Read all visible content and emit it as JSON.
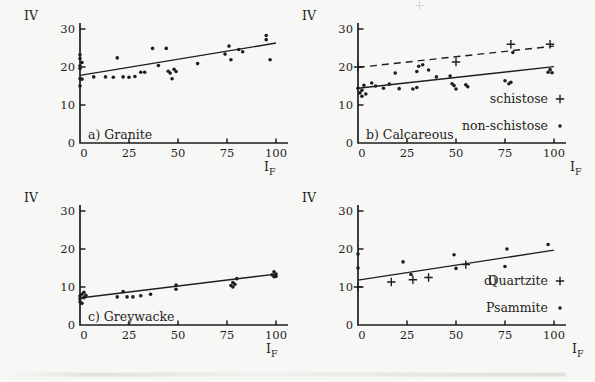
{
  "figure": {
    "background": "#f7f7f5",
    "ink": "#1e1e1c",
    "y_axis_label": "IV",
    "x_axis_label": "I",
    "x_axis_label_sub": "F"
  },
  "chart_data": [
    {
      "id": "a",
      "type": "scatter",
      "title": "a) Granite",
      "xlabel": "IF",
      "ylabel": "IV",
      "xlim": [
        0,
        100
      ],
      "ylim": [
        0,
        30
      ],
      "xticks": [
        0,
        25,
        50,
        75,
        100
      ],
      "yticks": [
        0,
        10,
        20,
        30
      ],
      "grid": false,
      "series": [
        {
          "name": "granite",
          "marker": "dot",
          "points": [
            [
              0,
              15
            ],
            [
              0,
              16.9
            ],
            [
              1,
              16.8
            ],
            [
              0,
              19.6
            ],
            [
              0,
              20.3
            ],
            [
              1,
              21.2
            ],
            [
              0,
              22.2
            ],
            [
              0,
              23.2
            ],
            [
              7,
              17.4
            ],
            [
              13,
              17.4
            ],
            [
              17,
              17.3
            ],
            [
              19,
              22.4
            ],
            [
              22,
              17.4
            ],
            [
              25,
              17.3
            ],
            [
              28,
              17.5
            ],
            [
              31,
              18.6
            ],
            [
              33,
              18.6
            ],
            [
              37,
              24.9
            ],
            [
              40,
              20.4
            ],
            [
              44,
              24.9
            ],
            [
              45,
              18.9
            ],
            [
              46,
              18.4
            ],
            [
              47,
              16.9
            ],
            [
              48,
              19.4
            ],
            [
              49,
              18.8
            ],
            [
              60,
              20.9
            ],
            [
              74,
              23.4
            ],
            [
              76,
              25.5
            ],
            [
              77,
              21.9
            ],
            [
              81,
              24.6
            ],
            [
              83,
              24
            ],
            [
              95,
              28.3
            ],
            [
              95,
              27.2
            ],
            [
              97,
              21.9
            ]
          ]
        }
      ],
      "trend_lines": [
        {
          "style": "solid",
          "from": [
            0,
            17.8
          ],
          "to": [
            100,
            26.3
          ]
        }
      ],
      "legend": []
    },
    {
      "id": "b",
      "type": "scatter",
      "title": "b) Calcareous",
      "xlabel": "IF",
      "ylabel": "IV",
      "xlim": [
        0,
        100
      ],
      "ylim": [
        0,
        30
      ],
      "xticks": [
        0,
        25,
        50,
        75,
        100
      ],
      "yticks": [
        0,
        10,
        20,
        30
      ],
      "grid": false,
      "series": [
        {
          "name": "schistose",
          "marker": "plus",
          "points": [
            [
              0,
              20
            ],
            [
              50,
              21.3
            ],
            [
              78,
              26
            ],
            [
              98,
              26
            ]
          ]
        },
        {
          "name": "non-schistose",
          "marker": "dot",
          "points": [
            [
              0,
              14.4
            ],
            [
              1,
              13.2
            ],
            [
              2,
              12.3
            ],
            [
              2,
              13.9
            ],
            [
              3,
              15.2
            ],
            [
              4,
              12.9
            ],
            [
              7,
              15.8
            ],
            [
              9,
              15
            ],
            [
              13,
              14.4
            ],
            [
              16,
              15.5
            ],
            [
              19,
              18.4
            ],
            [
              21,
              14.3
            ],
            [
              28,
              14.2
            ],
            [
              30,
              14.6
            ],
            [
              30,
              18.8
            ],
            [
              31,
              20.2
            ],
            [
              33,
              20.6
            ],
            [
              36,
              19.2
            ],
            [
              40,
              17.4
            ],
            [
              47,
              17.6
            ],
            [
              48,
              15.6
            ],
            [
              49,
              15.1
            ],
            [
              50,
              14.2
            ],
            [
              55,
              15.3
            ],
            [
              56,
              14.8
            ],
            [
              75,
              16.4
            ],
            [
              77,
              15.6
            ],
            [
              78,
              16
            ],
            [
              79,
              23.8
            ],
            [
              97,
              18.6
            ],
            [
              98,
              19.3
            ],
            [
              99,
              18.5
            ]
          ]
        }
      ],
      "trend_lines": [
        {
          "style": "dashed",
          "from": [
            0,
            19.9
          ],
          "to": [
            100,
            25.5
          ]
        },
        {
          "style": "solid",
          "from": [
            0,
            14.4
          ],
          "to": [
            100,
            20.1
          ]
        }
      ],
      "legend": [
        {
          "prefix": "",
          "label": "schistose",
          "marker": "plus"
        },
        {
          "prefix": "",
          "label": "non-schistose",
          "marker": "dot"
        }
      ]
    },
    {
      "id": "c",
      "type": "scatter",
      "title": "c) Greywacke",
      "xlabel": "IF",
      "ylabel": "IV",
      "xlim": [
        0,
        100
      ],
      "ylim": [
        0,
        30
      ],
      "xticks": [
        0,
        25,
        50,
        75,
        100
      ],
      "yticks": [
        0,
        10,
        20,
        30
      ],
      "grid": false,
      "series": [
        {
          "name": "greywacke",
          "marker": "dot",
          "points": [
            [
              0,
              6.1
            ],
            [
              1,
              5.7
            ],
            [
              0,
              6.9
            ],
            [
              0,
              7.6
            ],
            [
              1,
              8.1
            ],
            [
              2,
              8.6
            ],
            [
              2,
              7.2
            ],
            [
              3,
              7.8
            ],
            [
              19,
              7.4
            ],
            [
              22,
              8.8
            ],
            [
              24,
              7.4
            ],
            [
              27,
              7.4
            ],
            [
              31,
              7.7
            ],
            [
              36,
              8.1
            ],
            [
              49,
              9.4
            ],
            [
              49,
              10.5
            ],
            [
              77,
              10.4
            ],
            [
              78,
              11.2
            ],
            [
              78,
              10
            ],
            [
              79,
              10.7
            ],
            [
              80,
              12.2
            ],
            [
              98,
              13.2
            ],
            [
              99,
              14
            ],
            [
              99,
              12.7
            ],
            [
              100,
              13.4
            ],
            [
              100,
              12.8
            ]
          ]
        }
      ],
      "trend_lines": [
        {
          "style": "solid",
          "from": [
            0,
            7.1
          ],
          "to": [
            100,
            13.4
          ]
        }
      ],
      "legend": []
    },
    {
      "id": "d",
      "type": "scatter",
      "title": "",
      "xlabel": "IF",
      "ylabel": "IV",
      "xlim": [
        0,
        100
      ],
      "ylim": [
        0,
        30
      ],
      "xticks": [
        0,
        25,
        50,
        75,
        100
      ],
      "yticks": [
        0,
        10,
        20,
        30
      ],
      "grid": false,
      "series": [
        {
          "name": "Quartzite",
          "marker": "plus",
          "points": [
            [
              0,
              10
            ],
            [
              17,
              11.3
            ],
            [
              28,
              11.9
            ],
            [
              36,
              12.5
            ],
            [
              55,
              15.9
            ]
          ]
        },
        {
          "name": "Psammite",
          "marker": "dot",
          "points": [
            [
              0,
              15
            ],
            [
              0,
              18.7
            ],
            [
              23,
              16.6
            ],
            [
              27,
              13.3
            ],
            [
              49,
              18.5
            ],
            [
              50,
              14.9
            ],
            [
              75,
              15.4
            ],
            [
              76,
              20
            ],
            [
              97,
              21.2
            ]
          ]
        }
      ],
      "trend_lines": [
        {
          "style": "solid",
          "from": [
            0,
            11.8
          ],
          "to": [
            100,
            19.7
          ]
        }
      ],
      "legend": [
        {
          "prefix": "d)",
          "label": "Quartzite",
          "marker": "plus"
        },
        {
          "prefix": "",
          "label": "Psammite",
          "marker": "dot"
        }
      ]
    }
  ]
}
